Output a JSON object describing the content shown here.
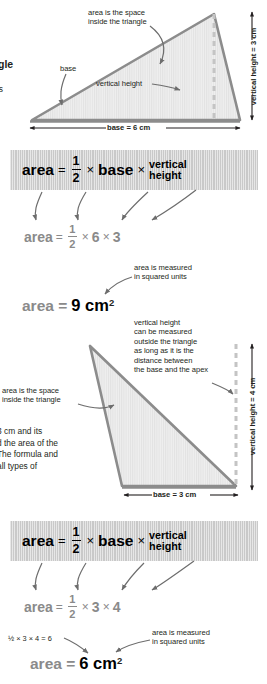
{
  "page": {
    "width": 267,
    "height": 684,
    "colors": {
      "text": "#231f20",
      "band_bg": "#c9c9c9",
      "gray_formula": "#8a8a8a",
      "triangle_stroke": "#8c8c8c",
      "triangle_fill": "#ededed",
      "dashed_line": "#c4c4c4",
      "arrow": "#6d6d6d"
    }
  },
  "body_text": {
    "heading_fragment": "gle",
    "subheading_fragment": "is",
    "paragraph_lines": [
      "3 cm and its",
      "d the area of the",
      "The formula and",
      "all types of"
    ]
  },
  "figure_one": {
    "name": "right-triangle-base-6-height-3",
    "base_label": "base = 6 cm",
    "height_label": "vertical height = 3 cm",
    "base_value": 6,
    "height_value": 3,
    "annotations": {
      "area_note_line1": "area is the space",
      "area_note_line2": "inside the triangle",
      "base_note": "base",
      "height_note": "vertical height"
    }
  },
  "formula_one": {
    "area_label": "area",
    "equals": "=",
    "fraction_numerator": "1",
    "fraction_denominator": "2",
    "times": "×",
    "base_label": "base",
    "height_line1": "vertical",
    "height_line2": "height"
  },
  "calculation_one": {
    "area_label": "area",
    "equals": "=",
    "fraction_numerator": "1",
    "fraction_denominator": "2",
    "times": "×",
    "base_value": "6",
    "height_value": "3"
  },
  "answer_one": {
    "lhs": "area =",
    "value": "9 cm",
    "exponent": "2",
    "note_line1": "area is measured",
    "note_line2": "in squared units"
  },
  "figure_two": {
    "name": "obtuse-triangle-base-3-height-4",
    "base_label": "base = 3 cm",
    "height_label": "vertical height = 4 cm",
    "base_value": 3,
    "height_value": 4,
    "annotations": {
      "area_note_line1": "area is the space",
      "area_note_line2": "inside the triangle",
      "height_note_lines": [
        "vertical height",
        "can be measured",
        "outside the triangle",
        "as long as it is the",
        "distance between",
        "the base and the apex"
      ]
    }
  },
  "formula_two": {
    "area_label": "area",
    "equals": "=",
    "fraction_numerator": "1",
    "fraction_denominator": "2",
    "times": "×",
    "base_label": "base",
    "height_line1": "vertical",
    "height_line2": "height"
  },
  "calculation_two": {
    "area_label": "area",
    "equals": "=",
    "fraction_numerator": "1",
    "fraction_denominator": "2",
    "times": "×",
    "base_value": "3",
    "height_value": "4"
  },
  "answer_two": {
    "lhs": "area =",
    "value": "6 cm",
    "exponent": "2",
    "mini_calc": "½ × 3 × 4 = 6",
    "note_line1": "area is measured",
    "note_line2": "in squared units"
  }
}
